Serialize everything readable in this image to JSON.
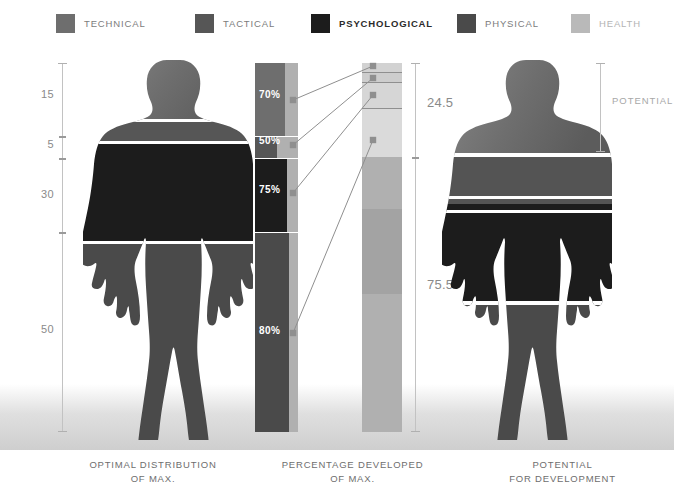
{
  "legend": {
    "items": [
      {
        "label": "TECHNICAL",
        "color": "#6e6e6e",
        "x": 56,
        "text_w": 90,
        "style": "normal"
      },
      {
        "label": "TACTICAL",
        "color": "#565656",
        "x": 195,
        "text_w": 80,
        "style": "normal"
      },
      {
        "label": "PSYCHOLOGICAL",
        "color": "#1c1c1c",
        "x": 311,
        "text_w": 120,
        "style": "strong"
      },
      {
        "label": "PHYSICAL",
        "color": "#4a4a4a",
        "x": 457,
        "text_w": 80,
        "style": "normal"
      },
      {
        "label": "HEALTH",
        "color": "#b9b9b9",
        "x": 571,
        "text_w": 70,
        "style": "light"
      }
    ]
  },
  "colors": {
    "technical": "#6e6e6e",
    "tactical": "#565656",
    "psychological": "#1c1c1c",
    "physical": "#4a4a4a",
    "health": "#b9b9b9",
    "health_light": "#d2d2d2",
    "bar_track": "#b0b0b0",
    "axis": "#c2c2c2",
    "connector": "#8f8f8f",
    "text_muted": "#8a8a8a",
    "caption": "#6e6e6e"
  },
  "left_axis": {
    "name": "optimal-distribution-scale",
    "top": 63,
    "bottom": 432,
    "values": [
      "15",
      "5",
      "30",
      "50"
    ],
    "ticks": [
      {
        "label": "15",
        "label_y": 95,
        "seg_top": 63,
        "seg_bottom": 136
      },
      {
        "label": "5",
        "label_y": 145,
        "seg_top": 136,
        "seg_bottom": 158
      },
      {
        "label": "30",
        "label_y": 195,
        "seg_top": 158,
        "seg_bottom": 232
      },
      {
        "label": "50",
        "label_y": 330,
        "seg_top": 232,
        "seg_bottom": 432
      }
    ],
    "tick_positions": [
      136,
      158,
      232
    ]
  },
  "middle_bar": {
    "name": "percentage-developed-bar",
    "x": 255,
    "width": 43,
    "top": 63,
    "bottom": 432,
    "track_color": "#b0b0b0",
    "segments": [
      {
        "key": "technical",
        "label": "70%",
        "color": "#6e6e6e",
        "top": 63,
        "height": 73,
        "fill_ratio": 0.7,
        "label_y": 95
      },
      {
        "key": "tactical",
        "label": "50%",
        "color": "#565656",
        "top": 136,
        "height": 22,
        "fill_ratio": 0.5,
        "label_y": 141
      },
      {
        "key": "psychological",
        "label": "75%",
        "color": "#1c1c1c",
        "top": 158,
        "height": 74,
        "fill_ratio": 0.75,
        "label_y": 190
      },
      {
        "key": "physical",
        "label": "80%",
        "color": "#4a4a4a",
        "top": 232,
        "height": 200,
        "fill_ratio": 0.8,
        "label_y": 331
      }
    ]
  },
  "right_bar": {
    "name": "potential-for-development-bar",
    "x": 362,
    "width": 40,
    "top": 63,
    "bottom": 432,
    "segments": [
      {
        "key": "technical-gap",
        "color": "#d2d2d2",
        "top": 63,
        "height": 9
      },
      {
        "key": "tactical-gap",
        "color": "#cdcdcd",
        "top": 73,
        "height": 9
      },
      {
        "key": "psychological-gap",
        "color": "#d6d6d6",
        "top": 83,
        "height": 25
      },
      {
        "key": "health",
        "color": "#dadada",
        "top": 109,
        "height": 48
      },
      {
        "key": "physical-dev-upper",
        "color": "#b0b0b0",
        "top": 157,
        "height": 52
      },
      {
        "key": "physical-dev-mid",
        "color": "#a3a3a3",
        "top": 209,
        "height": 85
      },
      {
        "key": "physical-dev-lower",
        "color": "#b0b0b0",
        "top": 294,
        "height": 138
      }
    ],
    "dividers": [
      72,
      82,
      108
    ]
  },
  "right_axis": {
    "name": "potential-scale",
    "top": 63,
    "bottom": 432,
    "split": 157,
    "labels": [
      {
        "value": "24.5",
        "y": 103
      },
      {
        "value": "75.5",
        "y": 285
      }
    ]
  },
  "potential_bracket": {
    "label": "POTENTIAL",
    "top": 63,
    "bottom": 152,
    "x": 600,
    "label_x": 612,
    "label_y": 101
  },
  "connectors": {
    "name": "segment-connector-lines",
    "lines": [
      {
        "x1": 293,
        "y1": 100,
        "x2": 373,
        "y2": 66
      },
      {
        "x1": 293,
        "y1": 145,
        "x2": 373,
        "y2": 78
      },
      {
        "x1": 293,
        "y1": 193,
        "x2": 373,
        "y2": 95
      },
      {
        "x1": 293,
        "y1": 333,
        "x2": 373,
        "y2": 140
      }
    ],
    "dot_radius": 3.2
  },
  "captions": [
    {
      "name": "caption-optimal",
      "line1": "OPTIMAL DISTRIBUTION",
      "line2": "OF MAX.",
      "x": 48,
      "width": 210
    },
    {
      "name": "caption-percentage",
      "line1": "PERCENTAGE DEVELOPED",
      "line2": "OF MAX.",
      "x": 245,
      "width": 215
    },
    {
      "name": "caption-potential",
      "line1": "POTENTIAL",
      "line2": "FOR DEVELOPMENT",
      "x": 455,
      "width": 215
    }
  ],
  "figures": {
    "left": {
      "name": "figure-optimal-distribution",
      "bands": [
        {
          "key": "head-shoulders",
          "color": "#6e6e6e"
        },
        {
          "key": "upper-chest",
          "color": "#565656"
        },
        {
          "key": "torso-arms",
          "color": "#1c1c1c"
        },
        {
          "key": "legs",
          "color": "#4a4a4a"
        }
      ]
    },
    "right": {
      "name": "figure-potential-for-development",
      "bands": [
        {
          "key": "head-shoulders",
          "color": "#6e6e6e"
        },
        {
          "key": "chest-upper-arms",
          "color": "#545454"
        },
        {
          "key": "hips-thighs",
          "color": "#1c1c1c"
        },
        {
          "key": "lower-legs",
          "color": "#4a4a4a"
        }
      ]
    }
  },
  "chart_data": {
    "type": "bar",
    "series": [
      {
        "name": "OPTIMAL DISTRIBUTION OF MAX.",
        "categories": [
          "TECHNICAL",
          "TACTICAL",
          "PSYCHOLOGICAL",
          "PHYSICAL"
        ],
        "values": [
          15,
          5,
          30,
          50
        ],
        "unit": "%"
      },
      {
        "name": "PERCENTAGE DEVELOPED OF MAX.",
        "categories": [
          "TECHNICAL",
          "TACTICAL",
          "PSYCHOLOGICAL",
          "PHYSICAL"
        ],
        "values": [
          70,
          50,
          75,
          80
        ],
        "unit": "%"
      },
      {
        "name": "POTENTIAL FOR DEVELOPMENT",
        "categories": [
          "POTENTIAL",
          "DEVELOPED"
        ],
        "values": [
          24.5,
          75.5
        ],
        "unit": "%"
      }
    ],
    "xlabel": "",
    "ylabel": "",
    "ylim": [
      0,
      100
    ],
    "grid": false,
    "legend_position": "top"
  }
}
